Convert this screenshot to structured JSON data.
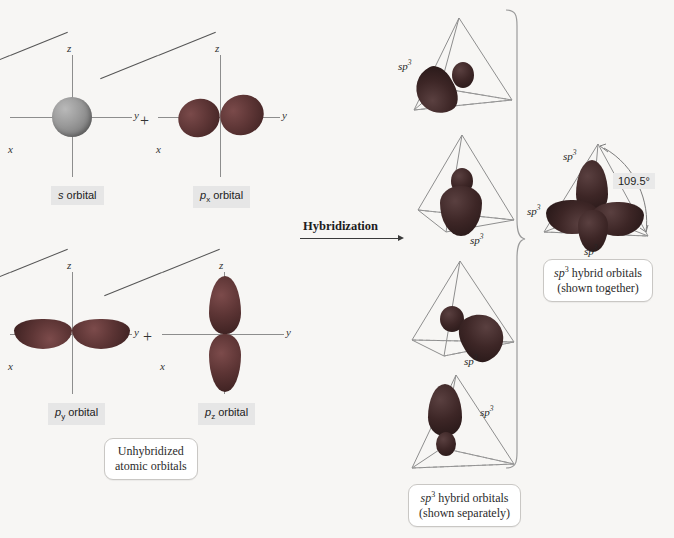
{
  "figure": {
    "background_color": "#f7f6f4",
    "orbital_color": "#5d3535",
    "s_orbital_color": "#8d8d8d"
  },
  "axis_labels": {
    "x": "x",
    "y": "y",
    "z": "z"
  },
  "operators": {
    "plus": "+"
  },
  "left_panel": {
    "orbitals": [
      {
        "id": "s",
        "symbol": "s",
        "sub": "",
        "label_suffix": " orbital"
      },
      {
        "id": "px",
        "symbol": "p",
        "sub": "x",
        "label_suffix": " orbital"
      },
      {
        "id": "py",
        "symbol": "p",
        "sub": "y",
        "label_suffix": " orbital"
      },
      {
        "id": "pz",
        "symbol": "p",
        "sub": "z",
        "label_suffix": " orbital"
      }
    ],
    "callout": {
      "line1": "Unhybridized",
      "line2": "atomic orbitals"
    }
  },
  "process": {
    "arrow_label": "Hybridization"
  },
  "middle_panel": {
    "tetrahedra": [
      {
        "index": 1,
        "sp3_label": "sp",
        "sp3_exponent": "3",
        "lobe_direction": "down-left"
      },
      {
        "index": 2,
        "sp3_label": "sp",
        "sp3_exponent": "3",
        "lobe_direction": "down"
      },
      {
        "index": 3,
        "sp3_label": "sp",
        "sp3_exponent": "3",
        "lobe_direction": "down-right"
      },
      {
        "index": 4,
        "sp3_label": "sp",
        "sp3_exponent": "3",
        "lobe_direction": "up"
      }
    ],
    "callout": {
      "line1_sym": "sp",
      "line1_exp": "3",
      "line1_rest": " hybrid orbitals",
      "line2": "(shown separately)"
    }
  },
  "right_panel": {
    "sp3_labels": [
      {
        "position": "top-left",
        "sym": "sp",
        "exp": "3"
      },
      {
        "position": "left",
        "sym": "sp",
        "exp": "3"
      },
      {
        "position": "bottom",
        "sym": "sp",
        "exp": "3"
      }
    ],
    "bond_angle": "109.5°",
    "callout": {
      "line1_sym": "sp",
      "line1_exp": "3",
      "line1_rest": " hybrid orbitals",
      "line2": "(shown together)"
    }
  }
}
